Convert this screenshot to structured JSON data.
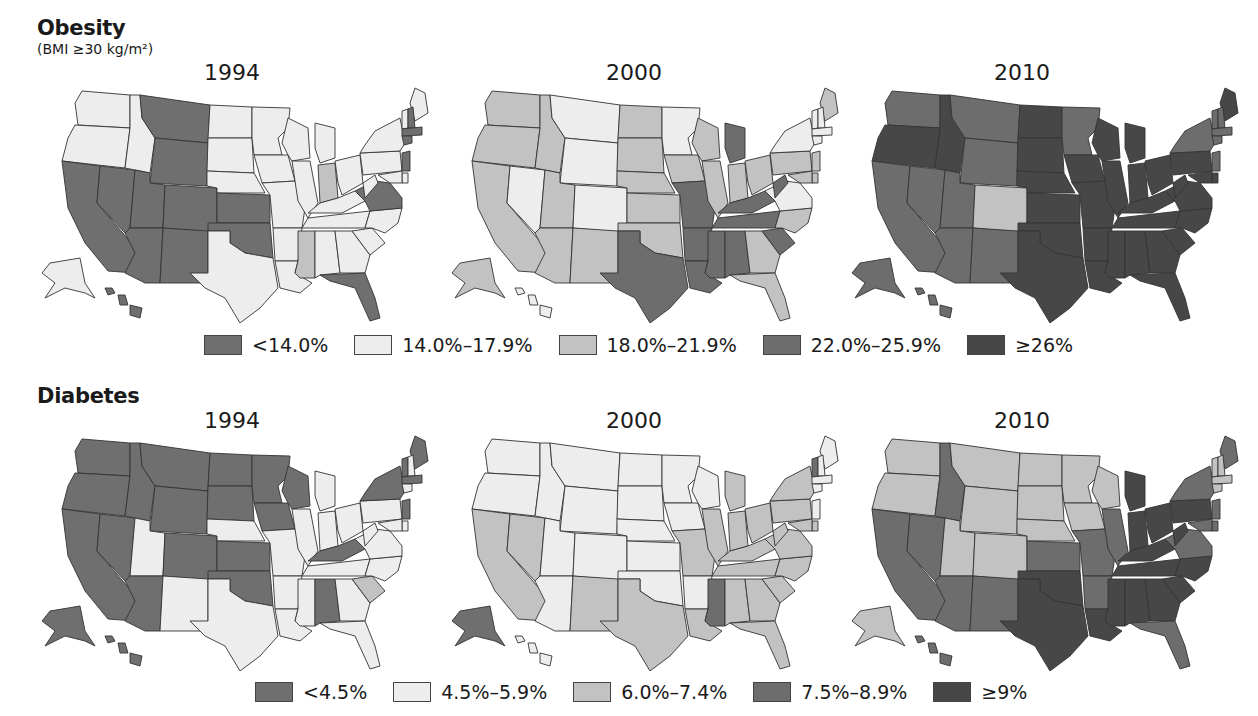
{
  "chart_data": [
    {
      "type": "map",
      "title": "Obesity",
      "subtitle": "(BMI ≥30 kg/m²)",
      "years": [
        "1994",
        "2000",
        "2010"
      ],
      "legend": [
        {
          "label": "<14.0%",
          "color": "#6f6f6f"
        },
        {
          "label": "14.0%–17.9%",
          "color": "#ededed"
        },
        {
          "label": "18.0%–21.9%",
          "color": "#c2c2c2"
        },
        {
          "label": "22.0%–25.9%",
          "color": "#6d6d6d"
        },
        {
          "label": "≥26%",
          "color": "#474747"
        }
      ],
      "maps": {
        "1994": {
          "WA": 1,
          "OR": 1,
          "CA": 0,
          "NV": 0,
          "ID": 1,
          "MT": 0,
          "WY": 0,
          "UT": 0,
          "CO": 0,
          "AZ": 0,
          "NM": 0,
          "ND": 1,
          "SD": 1,
          "NE": 1,
          "KS": 0,
          "OK": 0,
          "TX": 1,
          "MN": 1,
          "IA": 1,
          "MO": 1,
          "AR": 1,
          "LA": 1,
          "WI": 1,
          "IL": 1,
          "MI": 1,
          "IN": 2,
          "OH": 1,
          "KY": 1,
          "TN": 1,
          "MS": 2,
          "AL": 1,
          "GA": 1,
          "FL": 0,
          "SC": 1,
          "NC": 1,
          "VA": 0,
          "WV": 1,
          "PA": 1,
          "NY": 1,
          "ME": 1,
          "VT": 1,
          "NH": 0,
          "MA": 0,
          "CT": 0,
          "NJ": 0,
          "DE": 1,
          "MD": 1,
          "AK": 1,
          "HI": 0
        },
        "2000": {
          "WA": 2,
          "OR": 2,
          "CA": 2,
          "NV": 1,
          "ID": 2,
          "MT": 1,
          "WY": 1,
          "UT": 2,
          "CO": 1,
          "AZ": 2,
          "NM": 2,
          "ND": 2,
          "SD": 2,
          "NE": 2,
          "KS": 2,
          "OK": 2,
          "TX": 3,
          "MN": 1,
          "IA": 2,
          "MO": 3,
          "AR": 3,
          "LA": 3,
          "WI": 2,
          "IL": 2,
          "MI": 3,
          "IN": 2,
          "OH": 2,
          "KY": 3,
          "TN": 3,
          "MS": 3,
          "AL": 3,
          "GA": 2,
          "FL": 2,
          "SC": 3,
          "NC": 2,
          "VA": 1,
          "WV": 3,
          "PA": 2,
          "NY": 1,
          "ME": 2,
          "VT": 1,
          "NH": 1,
          "MA": 1,
          "CT": 1,
          "NJ": 2,
          "DE": 2,
          "MD": 2,
          "AK": 2,
          "HI": 1
        },
        "2010": {
          "WA": 3,
          "OR": 4,
          "CA": 3,
          "NV": 3,
          "ID": 4,
          "MT": 3,
          "WY": 3,
          "UT": 3,
          "CO": 2,
          "AZ": 3,
          "NM": 3,
          "ND": 4,
          "SD": 4,
          "NE": 4,
          "KS": 4,
          "OK": 4,
          "TX": 4,
          "MN": 3,
          "IA": 4,
          "MO": 4,
          "AR": 4,
          "LA": 4,
          "WI": 4,
          "IL": 4,
          "MI": 4,
          "IN": 4,
          "OH": 4,
          "KY": 4,
          "TN": 4,
          "MS": 4,
          "AL": 4,
          "GA": 4,
          "FL": 4,
          "SC": 4,
          "NC": 4,
          "VA": 4,
          "WV": 4,
          "PA": 4,
          "NY": 3,
          "ME": 4,
          "VT": 3,
          "NH": 3,
          "MA": 3,
          "CT": 3,
          "NJ": 3,
          "DE": 4,
          "MD": 4,
          "AK": 3,
          "HI": 3
        }
      }
    },
    {
      "type": "map",
      "title": "Diabetes",
      "years": [
        "1994",
        "2000",
        "2010"
      ],
      "legend": [
        {
          "label": "<4.5%",
          "color": "#6f6f6f"
        },
        {
          "label": "4.5%–5.9%",
          "color": "#ededed"
        },
        {
          "label": "6.0%–7.4%",
          "color": "#c2c2c2"
        },
        {
          "label": "7.5%–8.9%",
          "color": "#6d6d6d"
        },
        {
          "label": "≥9%",
          "color": "#474747"
        }
      ],
      "maps": {
        "1994": {
          "WA": 0,
          "OR": 0,
          "CA": 0,
          "NV": 0,
          "ID": 0,
          "MT": 0,
          "WY": 0,
          "UT": 1,
          "CO": 0,
          "AZ": 0,
          "NM": 1,
          "ND": 0,
          "SD": 0,
          "NE": 1,
          "KS": 0,
          "OK": 0,
          "TX": 1,
          "MN": 0,
          "IA": 0,
          "MO": 1,
          "AR": 1,
          "LA": 1,
          "WI": 0,
          "IL": 1,
          "MI": 1,
          "IN": 1,
          "OH": 1,
          "KY": 0,
          "TN": 1,
          "MS": 1,
          "AL": 0,
          "GA": 1,
          "FL": 1,
          "SC": 2,
          "NC": 1,
          "VA": 1,
          "WV": 1,
          "PA": 1,
          "NY": 0,
          "ME": 0,
          "VT": 0,
          "NH": 1,
          "MA": 0,
          "CT": 1,
          "NJ": 0,
          "DE": 1,
          "MD": 1,
          "AK": 0,
          "HI": 0
        },
        "2000": {
          "WA": 1,
          "OR": 1,
          "CA": 2,
          "NV": 2,
          "ID": 1,
          "MT": 1,
          "WY": 1,
          "UT": 1,
          "CO": 1,
          "AZ": 1,
          "NM": 2,
          "ND": 1,
          "SD": 1,
          "NE": 1,
          "KS": 1,
          "OK": 1,
          "TX": 2,
          "MN": 1,
          "IA": 1,
          "MO": 2,
          "AR": 1,
          "LA": 2,
          "WI": 1,
          "IL": 2,
          "MI": 2,
          "IN": 2,
          "OH": 2,
          "KY": 2,
          "TN": 2,
          "MS": 3,
          "AL": 2,
          "GA": 2,
          "FL": 2,
          "SC": 2,
          "NC": 2,
          "VA": 2,
          "WV": 2,
          "PA": 2,
          "NY": 2,
          "ME": 1,
          "VT": 3,
          "NH": 1,
          "MA": 1,
          "CT": 1,
          "NJ": 1,
          "DE": 2,
          "MD": 2,
          "AK": 0,
          "HI": 1
        },
        "2010": {
          "WA": 2,
          "OR": 2,
          "CA": 3,
          "NV": 3,
          "ID": 3,
          "MT": 2,
          "WY": 2,
          "UT": 2,
          "CO": 2,
          "AZ": 3,
          "NM": 3,
          "ND": 2,
          "SD": 2,
          "NE": 2,
          "KS": 3,
          "OK": 4,
          "TX": 4,
          "MN": 2,
          "IA": 2,
          "MO": 3,
          "AR": 3,
          "LA": 4,
          "WI": 2,
          "IL": 3,
          "MI": 4,
          "IN": 4,
          "OH": 4,
          "KY": 4,
          "TN": 4,
          "MS": 4,
          "AL": 4,
          "GA": 4,
          "FL": 3,
          "SC": 4,
          "NC": 4,
          "VA": 3,
          "WV": 4,
          "PA": 4,
          "NY": 3,
          "ME": 3,
          "VT": 2,
          "NH": 2,
          "MA": 2,
          "CT": 2,
          "NJ": 3,
          "DE": 3,
          "MD": 3,
          "AK": 2,
          "HI": 3
        }
      }
    }
  ],
  "obesity": {
    "title": "Obesity",
    "subtitle": "(BMI ≥30 kg/m²)",
    "years": [
      "1994",
      "2000",
      "2010"
    ],
    "legend": [
      "<14.0%",
      "14.0%–17.9%",
      "18.0%–21.9%",
      "22.0%–25.9%",
      "≥26%"
    ]
  },
  "diabetes": {
    "title": "Diabetes",
    "years": [
      "1994",
      "2000",
      "2010"
    ],
    "legend": [
      "<4.5%",
      "4.5%–5.9%",
      "6.0%–7.4%",
      "7.5%–8.9%",
      "≥9%"
    ]
  },
  "palette": [
    "#6f6f6f",
    "#ededed",
    "#c2c2c2",
    "#6d6d6d",
    "#474747"
  ],
  "stroke": "#333333"
}
